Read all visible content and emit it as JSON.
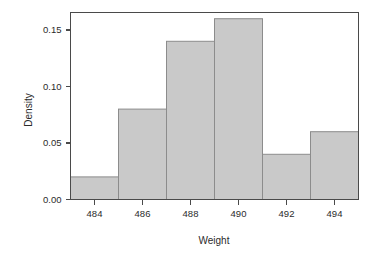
{
  "chart_data": {
    "type": "bar",
    "title": "",
    "subtitle": "",
    "xlabel": "Weight",
    "ylabel": "Density",
    "categories": [
      "483-485",
      "485-487",
      "487-489",
      "489-491",
      "491-493",
      "493-495"
    ],
    "bin_edges": [
      483,
      485,
      487,
      489,
      491,
      493,
      495
    ],
    "values": [
      0.02,
      0.08,
      0.14,
      0.16,
      0.04,
      0.06
    ],
    "xlim": [
      483,
      495
    ],
    "ylim": [
      0,
      0.17
    ],
    "x_ticks": [
      484,
      486,
      488,
      490,
      492,
      494
    ],
    "x_tick_labels": [
      "484",
      "486",
      "488",
      "490",
      "492",
      "494"
    ],
    "y_ticks": [
      0.0,
      0.05,
      0.1,
      0.15
    ],
    "y_tick_labels": [
      "0.00",
      "0.05",
      "0.10",
      "0.15"
    ],
    "grid": false,
    "legend": null,
    "legend_position": "none",
    "bar_fill_color": "#c9c9c9",
    "bar_edge_color": "#8c8c8c",
    "axis_color": "#4a4a4a",
    "background_color": "#ffffff"
  },
  "axis_labels": {
    "x_title": "Weight",
    "y_title": "Density"
  }
}
